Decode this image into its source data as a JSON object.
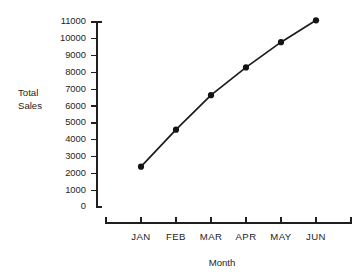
{
  "chart_data": {
    "type": "line",
    "title": "",
    "xlabel": "Month",
    "ylabel": "Total Sales",
    "ylabel_lines": [
      "Total",
      "Sales"
    ],
    "categories": [
      "JAN",
      "FEB",
      "MAR",
      "APR",
      "MAY",
      "JUN"
    ],
    "values": [
      2400,
      4600,
      6650,
      8300,
      9800,
      11100
    ],
    "series": [
      {
        "name": "Total Sales",
        "values": [
          2400,
          4600,
          6650,
          8300,
          9800,
          11100
        ]
      }
    ],
    "ylim": [
      0,
      11000
    ],
    "xlim": [
      0,
      7
    ],
    "ytick_labels": [
      "11000",
      "10000",
      "9000",
      "8000",
      "7000",
      "6000",
      "5000",
      "4000",
      "3000",
      "2000",
      "1000",
      "0"
    ],
    "ytick_values": [
      11000,
      10000,
      9000,
      8000,
      7000,
      6000,
      5000,
      4000,
      3000,
      2000,
      1000,
      0
    ],
    "xtick_labels": [
      "JAN",
      "FEB",
      "MAR",
      "APR",
      "MAY",
      "JUN"
    ],
    "grid": false,
    "legend": false,
    "legend_position": "none",
    "marker": "filled-circle",
    "colors": {
      "line": "#1c1c1c",
      "marker": "#141414",
      "axis": "#1f1f1f",
      "text": "#242424",
      "background": "#ffffff"
    }
  }
}
